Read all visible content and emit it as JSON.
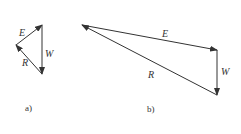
{
  "diagram_a": {
    "caption": "a)",
    "vectors": [
      {
        "label": "E",
        "from": [
          16,
          45
        ],
        "to": [
          42,
          25
        ]
      },
      {
        "label": "W",
        "from": [
          42,
          25
        ],
        "to": [
          42,
          74
        ]
      },
      {
        "label": "R",
        "from": [
          42,
          74
        ],
        "to": [
          16,
          45
        ]
      }
    ]
  },
  "diagram_b": {
    "caption": "b)",
    "vectors": [
      {
        "label": "E",
        "from": [
          82,
          25
        ],
        "to": [
          217,
          50
        ]
      },
      {
        "label": "W",
        "from": [
          217,
          50
        ],
        "to": [
          217,
          95
        ]
      },
      {
        "label": "R",
        "from": [
          217,
          95
        ],
        "to": [
          82,
          25
        ]
      }
    ]
  },
  "colors": {
    "line": "#333333",
    "background": "#ffffff"
  }
}
